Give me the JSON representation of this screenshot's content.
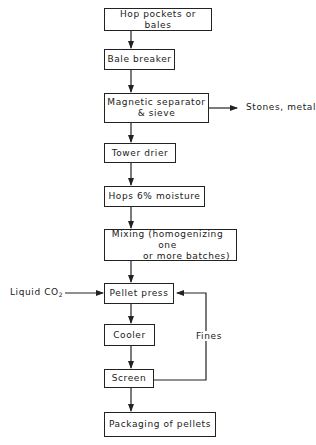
{
  "diagram": {
    "type": "flowchart",
    "title": "",
    "nodes": [
      {
        "id": "hop_pockets",
        "label": "Hop pockets or bales"
      },
      {
        "id": "bale_breaker",
        "label": "Bale breaker"
      },
      {
        "id": "magnetic_separator",
        "line1": "Magnetic separator",
        "line2": "& sieve"
      },
      {
        "id": "tower_drier",
        "label": "Tower drier"
      },
      {
        "id": "hops_moisture",
        "label": "Hops 6% moisture"
      },
      {
        "id": "mixing",
        "line1": "Mixing (homogenizing one",
        "line2": "or more batches)"
      },
      {
        "id": "pellet_press",
        "label": "Pellet press"
      },
      {
        "id": "cooler",
        "label": "Cooler"
      },
      {
        "id": "screen",
        "label": "Screen"
      },
      {
        "id": "packaging",
        "label": "Packaging of pellets"
      }
    ],
    "side_labels": {
      "stones_metal": "Stones, metal",
      "liquid_co2_prefix": "Liquid CO",
      "liquid_co2_sub": "2",
      "fines": "Fines"
    },
    "edges": [
      {
        "from": "hop_pockets",
        "to": "bale_breaker"
      },
      {
        "from": "bale_breaker",
        "to": "magnetic_separator"
      },
      {
        "from": "magnetic_separator",
        "to": "stones_metal"
      },
      {
        "from": "magnetic_separator",
        "to": "tower_drier"
      },
      {
        "from": "tower_drier",
        "to": "hops_moisture"
      },
      {
        "from": "hops_moisture",
        "to": "mixing"
      },
      {
        "from": "mixing",
        "to": "pellet_press"
      },
      {
        "from": "liquid_co2",
        "to": "pellet_press"
      },
      {
        "from": "pellet_press",
        "to": "cooler"
      },
      {
        "from": "cooler",
        "to": "screen"
      },
      {
        "from": "screen",
        "to": "pellet_press",
        "label": "Fines"
      },
      {
        "from": "screen",
        "to": "packaging"
      }
    ]
  }
}
